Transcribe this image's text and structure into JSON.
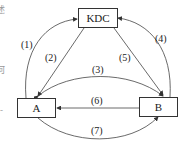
{
  "diagram": {
    "nodes": [
      {
        "id": "kdc",
        "label": "KDC"
      },
      {
        "id": "a",
        "label": "A"
      },
      {
        "id": "b",
        "label": "B"
      }
    ],
    "edges": [
      {
        "label": "(1)",
        "from": "A",
        "to": "KDC"
      },
      {
        "label": "(2)",
        "from": "KDC",
        "to": "A"
      },
      {
        "label": "(3)",
        "from": "A",
        "to": "B",
        "bidirectional": true
      },
      {
        "label": "(4)",
        "from": "B",
        "to": "KDC"
      },
      {
        "label": "(5)",
        "from": "KDC",
        "to": "B"
      },
      {
        "label": "(6)",
        "from": "B",
        "to": "A"
      },
      {
        "label": "(7)",
        "from": "A",
        "to": "B"
      }
    ],
    "cropped_left_text": [
      "述",
      "何",
      "-"
    ]
  }
}
